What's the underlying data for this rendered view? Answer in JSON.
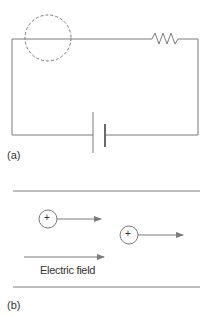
{
  "figure_a": {
    "label": "(a)",
    "components": [
      "dashed-circle",
      "resistor",
      "battery",
      "wires"
    ]
  },
  "figure_b": {
    "label": "(b)",
    "field_label": "Electric field",
    "charges": [
      {
        "sign": "+"
      },
      {
        "sign": "+"
      }
    ]
  },
  "colors": {
    "line": "#7a7a7a",
    "text": "#333333",
    "background": "#ffffff"
  }
}
